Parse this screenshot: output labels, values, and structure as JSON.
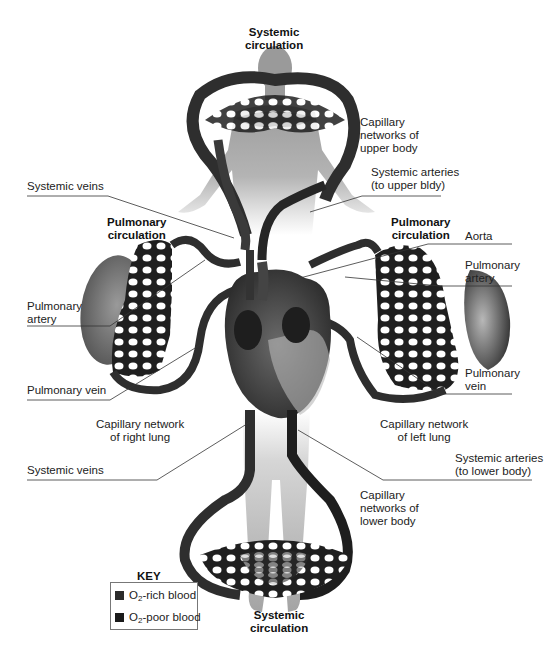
{
  "diagram": {
    "colors": {
      "o2_rich": "#2b2b2b",
      "o2_poor": "#1a1a1a",
      "body": "#a8a8a8",
      "lung": "#6e6e6e",
      "vessel": "#2e2e2e"
    },
    "labels": {
      "systemic_top": [
        "Systemic",
        "circulation"
      ],
      "systemic_bottom": [
        "Systemic",
        "circulation"
      ],
      "pulmonary_left": [
        "Pulmonary",
        "circulation"
      ],
      "pulmonary_right": [
        "Pulmonary",
        "circulation"
      ],
      "cap_upper": [
        "Capillary",
        "networks of",
        "upper body"
      ],
      "sys_art_upper": [
        "Systemic arteries",
        "(to upper bldy)"
      ],
      "sys_veins_upper": "Systemic veins",
      "aorta": "Aorta",
      "pulm_artery_right": [
        "Pulmonary",
        "artery"
      ],
      "pulm_artery_left": [
        "Pulmonary",
        "artery"
      ],
      "pulm_vein_right": [
        "Pulmonary",
        "vein"
      ],
      "pulm_vein_left": "Pulmonary vein",
      "cap_right_lung": [
        "Capillary network",
        "of right lung"
      ],
      "cap_left_lung": [
        "Capillary network",
        "of left lung"
      ],
      "sys_veins_lower": "Systemic veins",
      "sys_art_lower": [
        "Systemic arteries",
        "(to lower body)"
      ],
      "cap_lower": [
        "Capillary",
        "networks of",
        "lower body"
      ]
    },
    "key": {
      "title": "KEY",
      "items": [
        {
          "prefix": "O",
          "sub": "2",
          "suffix": "-rich blood",
          "color": "#2b2b2b"
        },
        {
          "prefix": "O",
          "sub": "2",
          "suffix": "-poor blood",
          "color": "#1a1a1a"
        }
      ]
    }
  }
}
